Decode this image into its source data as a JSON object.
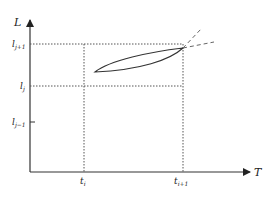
{
  "diagram": {
    "axes": {
      "y_label": "L",
      "x_label": "T"
    },
    "y_ticks": [
      {
        "base": "l",
        "sub": "j+1"
      },
      {
        "base": "l",
        "sub": "j"
      },
      {
        "base": "l",
        "sub": "j−1"
      }
    ],
    "x_ticks": [
      {
        "base": "t",
        "sub": "i"
      },
      {
        "base": "t",
        "sub": "i+1"
      }
    ],
    "colors": {
      "line": "#333333",
      "dotted": "#555555",
      "dashed": "#666666"
    }
  }
}
